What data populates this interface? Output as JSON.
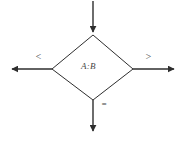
{
  "figure": {
    "type": "flowchart-decision-diamond",
    "canvas": {
      "width": 184,
      "height": 141,
      "background": "#ffffff"
    },
    "stroke_color": "#2e2e2e",
    "text_color": "#474747",
    "decision": {
      "condition_label": "A:B",
      "shape": "diamond",
      "vertices": {
        "top": [
          93,
          35
        ],
        "left": [
          52,
          69
        ],
        "right": [
          133,
          69
        ],
        "bottom": [
          93,
          100
        ]
      }
    },
    "connectors": [
      {
        "name": "input-arrow",
        "direction": "down",
        "from": [
          93,
          1
        ],
        "to": [
          93,
          34
        ],
        "label": ""
      },
      {
        "name": "less-than-branch",
        "direction": "left",
        "from": [
          52,
          69
        ],
        "to": [
          9,
          69
        ],
        "label": "<"
      },
      {
        "name": "greater-than-branch",
        "direction": "right",
        "from": [
          133,
          69
        ],
        "to": [
          177,
          69
        ],
        "label": ">"
      },
      {
        "name": "equal-branch",
        "direction": "down",
        "from": [
          93,
          100
        ],
        "to": [
          93,
          134
        ],
        "label": "="
      }
    ]
  }
}
